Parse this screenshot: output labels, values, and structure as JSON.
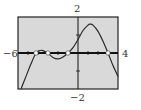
{
  "chart_data": {
    "type": "line",
    "title": "",
    "xlabel": "",
    "ylabel": "",
    "xlim": [
      -6,
      4
    ],
    "ylim": [
      -2,
      2
    ],
    "grid": false,
    "tick_labels": {
      "xmin": "−6",
      "xmax": "4",
      "ymin": "−2",
      "ymax": "2"
    },
    "series": [
      {
        "name": "f(x)",
        "x": [
          -5.7,
          -5.2,
          -4.7,
          -4.2,
          -3.9,
          -3.6,
          -3.3,
          -3.0,
          -2.5,
          -2.0,
          -1.5,
          -1.0,
          -0.5,
          0.0,
          0.5,
          1.0,
          1.2,
          1.5,
          2.0,
          2.5,
          3.0,
          3.5,
          4.0
        ],
        "y": [
          -2.0,
          -1.3,
          -0.6,
          0.0,
          0.12,
          0.15,
          0.08,
          0.0,
          -0.25,
          -0.33,
          -0.22,
          0.0,
          0.3,
          0.75,
          1.25,
          1.55,
          1.6,
          1.55,
          1.2,
          0.65,
          0.0,
          -0.7,
          -1.3
        ]
      }
    ],
    "zeros": [
      -4.2,
      -3.0,
      -1.0,
      3.0
    ],
    "marked_points": "open circles at x-intercepts",
    "colors": {
      "plot_background": "#d9d9d9",
      "curve": "#2a2a2a",
      "axis": "#111111",
      "frame": "#222222"
    }
  }
}
